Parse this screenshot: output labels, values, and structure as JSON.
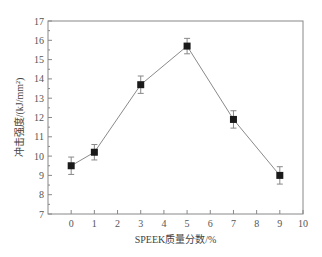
{
  "chart_data": {
    "type": "line",
    "title": "",
    "xlabel": "SPEEK质量分数/%",
    "ylabel": "冲击强度/(kJ/mm²)",
    "x": [
      0,
      1,
      3,
      5,
      7,
      9
    ],
    "series": [
      {
        "name": "冲击强度",
        "values": [
          9.5,
          10.2,
          13.7,
          15.7,
          11.9,
          9.0
        ],
        "error": [
          0.45,
          0.4,
          0.45,
          0.4,
          0.45,
          0.45
        ],
        "marker": "square",
        "color": "#1a1a1a",
        "line_color": "#888888"
      }
    ],
    "xlim": [
      -1,
      10
    ],
    "ylim": [
      7,
      17
    ],
    "xticks": [
      0,
      1,
      2,
      3,
      4,
      5,
      6,
      7,
      8,
      9,
      10
    ],
    "yticks": [
      7,
      8,
      9,
      10,
      11,
      12,
      13,
      14,
      15,
      16,
      17
    ],
    "grid": false,
    "legend": null
  },
  "colors": {
    "axis": "#888888",
    "marker": "#1a1a1a",
    "line": "#8a8a8a",
    "text": "#555555"
  }
}
